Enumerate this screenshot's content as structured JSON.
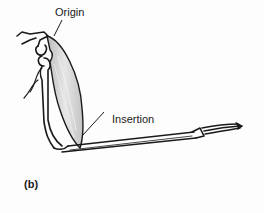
{
  "diagram": {
    "labels": {
      "origin": "Origin",
      "insertion": "Insertion",
      "figure": "(b)"
    },
    "colors": {
      "line": "#1a1a1a",
      "muscle_fill": "#d8d8d8",
      "background": "#fdfdfd"
    }
  }
}
